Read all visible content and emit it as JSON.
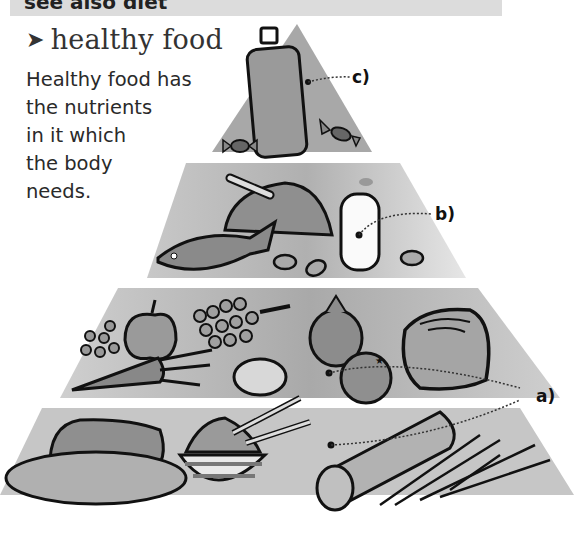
{
  "banner": {
    "text": "see also diet"
  },
  "entry": {
    "arrow_icon": "right-arrowhead-icon",
    "headword": "healthy food",
    "definition_lines": [
      "Healthy food has",
      "the nutrients",
      "in it which",
      "the body",
      "needs."
    ]
  },
  "pyramid": {
    "tiers": [
      {
        "level": "top",
        "items": [
          "bottle",
          "sweet",
          "sweet"
        ],
        "callout": "c)"
      },
      {
        "level": "upper-middle",
        "items": [
          "chicken",
          "fish",
          "milk bottle",
          "peanuts"
        ],
        "callout": "b)"
      },
      {
        "level": "lower-middle",
        "items": [
          "apple",
          "grapes",
          "peas",
          "carrot",
          "lemon",
          "onion",
          "orange",
          "cabbage"
        ],
        "callout": "a)"
      },
      {
        "level": "bottom",
        "items": [
          "bread loaf",
          "baguette",
          "rice bowl",
          "chopsticks",
          "pasta",
          "spaghetti"
        ],
        "callout": "a)"
      }
    ],
    "colors": {
      "tier_fill": "#b8b8b8",
      "tier_fill_light": "#d6d6d6",
      "outline": "#111111"
    }
  }
}
